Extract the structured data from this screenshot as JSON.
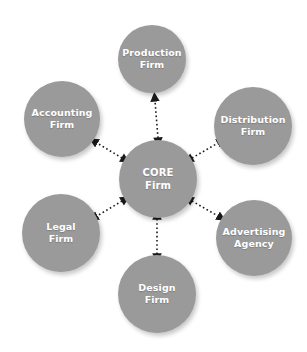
{
  "diagram": {
    "type": "hub-and-spoke network diagram",
    "title": "",
    "background_color": "#ffffff",
    "node_color": "#9a9a9a",
    "node_text_color": "#ffffff",
    "connector_color": "#1a1a1a",
    "connector_style": "dotted double-headed arrow",
    "nodes": [
      {
        "id": "core",
        "label": "CORE\nFirm",
        "role": "hub",
        "cx": 158,
        "cy": 179,
        "r": 39
      },
      {
        "id": "production",
        "label": "Production\nFirm",
        "role": "spoke",
        "cx": 152,
        "cy": 59,
        "r": 34
      },
      {
        "id": "distribution",
        "label": "Distribution\nFirm",
        "role": "spoke",
        "cx": 253,
        "cy": 126,
        "r": 39
      },
      {
        "id": "advertising",
        "label": "Advertising\nAgency",
        "role": "spoke",
        "cx": 254,
        "cy": 238,
        "r": 38
      },
      {
        "id": "design",
        "label": "Design\nFirm",
        "role": "spoke",
        "cx": 157,
        "cy": 294,
        "r": 39
      },
      {
        "id": "legal",
        "label": "Legal\nFirm",
        "role": "spoke",
        "cx": 61,
        "cy": 233,
        "r": 39
      },
      {
        "id": "accounting",
        "label": "Accounting\nFirm",
        "role": "spoke",
        "cx": 62,
        "cy": 119,
        "r": 38
      }
    ],
    "connectors": [
      {
        "id": "core-production",
        "from": "core",
        "to": "production",
        "x1": 158,
        "y1": 138,
        "x2": 155,
        "y2": 101
      },
      {
        "id": "core-distribution",
        "from": "core",
        "to": "distribution",
        "x1": 192,
        "y1": 158,
        "x2": 218,
        "y2": 143
      },
      {
        "id": "core-advertising",
        "from": "core",
        "to": "advertising",
        "x1": 192,
        "y1": 201,
        "x2": 218,
        "y2": 216
      },
      {
        "id": "core-design",
        "from": "core",
        "to": "design",
        "x1": 157,
        "y1": 219,
        "x2": 157,
        "y2": 254
      },
      {
        "id": "core-legal",
        "from": "core",
        "to": "legal",
        "x1": 122,
        "y1": 201,
        "x2": 97,
        "y2": 216
      },
      {
        "id": "core-accounting",
        "from": "core",
        "to": "accounting",
        "x1": 122,
        "y1": 158,
        "x2": 97,
        "y2": 143
      }
    ]
  }
}
